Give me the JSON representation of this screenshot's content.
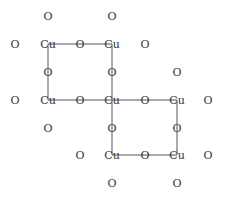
{
  "diagram": {
    "title": "",
    "cols": [
      15,
      48,
      80,
      112,
      145,
      177,
      208
    ],
    "rows": [
      16,
      44,
      72,
      100,
      128,
      155,
      183
    ],
    "atoms": [
      {
        "label": "O",
        "c": 1,
        "r": 0
      },
      {
        "label": "O",
        "c": 3,
        "r": 0
      },
      {
        "label": "O",
        "c": 0,
        "r": 1
      },
      {
        "label": "Cu",
        "c": 1,
        "r": 1
      },
      {
        "label": "O",
        "c": 2,
        "r": 1
      },
      {
        "label": "Cu",
        "c": 3,
        "r": 1
      },
      {
        "label": "O",
        "c": 4,
        "r": 1
      },
      {
        "label": "O",
        "c": 1,
        "r": 2
      },
      {
        "label": "O",
        "c": 3,
        "r": 2
      },
      {
        "label": "O",
        "c": 5,
        "r": 2
      },
      {
        "label": "O",
        "c": 0,
        "r": 3
      },
      {
        "label": "Cu",
        "c": 1,
        "r": 3
      },
      {
        "label": "O",
        "c": 2,
        "r": 3
      },
      {
        "label": "Cu",
        "c": 3,
        "r": 3
      },
      {
        "label": "O",
        "c": 4,
        "r": 3
      },
      {
        "label": "Cu",
        "c": 5,
        "r": 3
      },
      {
        "label": "O",
        "c": 6,
        "r": 3
      },
      {
        "label": "O",
        "c": 1,
        "r": 4
      },
      {
        "label": "O",
        "c": 3,
        "r": 4
      },
      {
        "label": "O",
        "c": 5,
        "r": 4
      },
      {
        "label": "O",
        "c": 2,
        "r": 5
      },
      {
        "label": "Cu",
        "c": 3,
        "r": 5
      },
      {
        "label": "O",
        "c": 4,
        "r": 5
      },
      {
        "label": "Cu",
        "c": 5,
        "r": 5
      },
      {
        "label": "O",
        "c": 6,
        "r": 5
      },
      {
        "label": "O",
        "c": 3,
        "r": 6
      },
      {
        "label": "O",
        "c": 5,
        "r": 6
      }
    ],
    "bonds": [
      [
        [
          1,
          1
        ],
        [
          3,
          1
        ]
      ],
      [
        [
          1,
          1
        ],
        [
          1,
          3
        ]
      ],
      [
        [
          3,
          1
        ],
        [
          3,
          5
        ]
      ],
      [
        [
          1,
          3
        ],
        [
          5,
          3
        ]
      ],
      [
        [
          5,
          3
        ],
        [
          5,
          5
        ]
      ],
      [
        [
          3,
          5
        ],
        [
          5,
          5
        ]
      ]
    ],
    "line_color": "#555555",
    "text_color": "#333333"
  }
}
